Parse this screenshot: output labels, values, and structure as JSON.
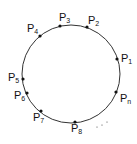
{
  "diagram": {
    "type": "points-on-circle",
    "circle": {
      "cx": 71,
      "cy": 74,
      "r": 49,
      "stroke": "#333333"
    },
    "points": [
      {
        "id": "P1",
        "base": "P",
        "sub": "1",
        "x": 117,
        "y": 59,
        "lx": 121,
        "ly": 62
      },
      {
        "id": "P2",
        "base": "P",
        "sub": "2",
        "x": 87,
        "y": 27,
        "lx": 88,
        "ly": 24
      },
      {
        "id": "P3",
        "base": "P",
        "sub": "3",
        "x": 60,
        "y": 26,
        "lx": 59,
        "ly": 21
      },
      {
        "id": "P4",
        "base": "P",
        "sub": "4",
        "x": 40,
        "y": 36,
        "lx": 27,
        "ly": 32
      },
      {
        "id": "P5",
        "base": "P",
        "sub": "5",
        "x": 23,
        "y": 79,
        "lx": 8,
        "ly": 81
      },
      {
        "id": "P6",
        "base": "P",
        "sub": "6",
        "x": 27,
        "y": 93,
        "lx": 14,
        "ly": 99
      },
      {
        "id": "P7",
        "base": "P",
        "sub": "7",
        "x": 41,
        "y": 111,
        "lx": 33,
        "ly": 121
      },
      {
        "id": "P8",
        "base": "P",
        "sub": "8",
        "x": 75,
        "y": 122,
        "lx": 71,
        "ly": 132
      },
      {
        "id": "Pn",
        "base": "P",
        "sub": "n",
        "x": 116,
        "y": 92,
        "lx": 120,
        "ly": 102
      }
    ],
    "ellipsis_dots": [
      {
        "x": 97,
        "y": 127
      },
      {
        "x": 102,
        "y": 125
      },
      {
        "x": 107,
        "y": 122
      }
    ]
  }
}
